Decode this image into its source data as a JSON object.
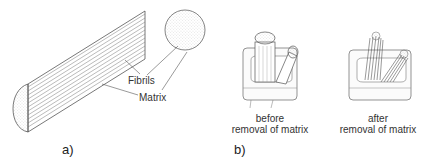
{
  "panel_a": {
    "caption": "a)",
    "labels": {
      "fibrils": "Fibrils",
      "matrix": "Matrix"
    }
  },
  "panel_b": {
    "caption": "b)",
    "left": {
      "line1": "before",
      "line2": "removal of matrix"
    },
    "right": {
      "line1": "after",
      "line2": "removal of matrix"
    }
  }
}
